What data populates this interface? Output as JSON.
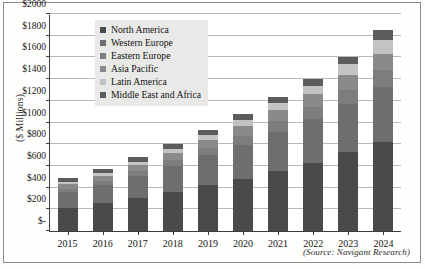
{
  "figure": {
    "source_note": "(Source: Navigant Research)",
    "ylabel": "($ Millions)",
    "frame_color": "#8d8d8a"
  },
  "chart_data": {
    "type": "bar",
    "stacked": true,
    "title": "",
    "subtitle": "",
    "xlabel": "",
    "ylabel": "($ Millions)",
    "ylim": [
      0,
      2000
    ],
    "ytick_values": [
      0,
      200,
      400,
      600,
      800,
      1000,
      1200,
      1400,
      1600,
      1800,
      2000
    ],
    "ytick_labels": [
      "$-",
      "$200",
      "$400",
      "$600",
      "$800",
      "$1000",
      "$1200",
      "$1400",
      "$1600",
      "$1800",
      "$2000"
    ],
    "grid": true,
    "grid_axis": "y",
    "legend_position": "upper-left-inside",
    "categories": [
      "2015",
      "2016",
      "2017",
      "2018",
      "2019",
      "2020",
      "2021",
      "2022",
      "2023",
      "2024"
    ],
    "series": [
      {
        "name": "North America",
        "color": "#4a4a4a",
        "values": [
          215,
          260,
          305,
          360,
          420,
          480,
          555,
          630,
          725,
          825
        ]
      },
      {
        "name": "Western Europe",
        "color": "#6e6e6e",
        "values": [
          145,
          165,
          205,
          240,
          280,
          315,
          360,
          400,
          445,
          500
        ]
      },
      {
        "name": "Eastern Europe",
        "color": "#7d7d7d",
        "values": [
          30,
          35,
          45,
          55,
          65,
          80,
          95,
          110,
          130,
          155
        ]
      },
      {
        "name": "Asia Pacific",
        "color": "#8a8a8a",
        "values": [
          45,
          50,
          55,
          65,
          75,
          90,
          105,
          120,
          135,
          155
        ]
      },
      {
        "name": "Latin America",
        "color": "#c3c3c3",
        "values": [
          20,
          22,
          28,
          35,
          45,
          55,
          65,
          80,
          100,
          130
        ]
      },
      {
        "name": "Middle East and Africa",
        "color": "#5c5c5c",
        "values": [
          35,
          38,
          42,
          45,
          50,
          55,
          60,
          60,
          70,
          85
        ]
      }
    ],
    "totals": [
      490,
      570,
      680,
      800,
      935,
      1075,
      1240,
      1400,
      1605,
      1850
    ]
  },
  "legend": {
    "items": [
      {
        "label": "North America",
        "color": "#4a4a4a"
      },
      {
        "label": "Western Europe",
        "color": "#6e6e6e"
      },
      {
        "label": "Eastern Europe",
        "color": "#7d7d7d"
      },
      {
        "label": "Asia Pacific",
        "color": "#8a8a8a"
      },
      {
        "label": "Latin America",
        "color": "#c3c3c3"
      },
      {
        "label": "Middle East and Africa",
        "color": "#5c5c5c"
      }
    ]
  }
}
